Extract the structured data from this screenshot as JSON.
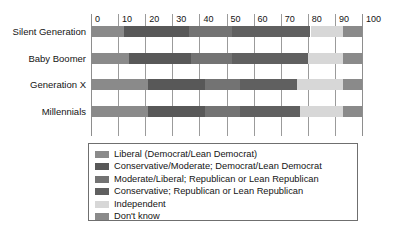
{
  "chart_data": {
    "type": "bar",
    "orientation": "horizontal",
    "stacked": true,
    "title": "",
    "xlabel": "",
    "ylabel": "",
    "xlim": [
      0,
      100
    ],
    "xticks": [
      0,
      10,
      20,
      30,
      40,
      50,
      60,
      70,
      80,
      90,
      100
    ],
    "grid": true,
    "legend_position": "bottom",
    "categories": [
      "Silent Generation",
      "Baby Boomer",
      "Generation X",
      "Millennials"
    ],
    "series": [
      {
        "name": "Liberal (Democrat/Lean Democrat)",
        "color": "#8a8a8a",
        "values": [
          12,
          14,
          21,
          21
        ]
      },
      {
        "name": "Conservative/Moderate; Democrat/Lean Democrat",
        "color": "#585858",
        "values": [
          24,
          23,
          21,
          21
        ]
      },
      {
        "name": "Moderate/Liberal; Republican or Lean Republican",
        "color": "#737373",
        "values": [
          16,
          15,
          13,
          13
        ]
      },
      {
        "name": "Conservative; Republican or Lean Republican",
        "color": "#606060",
        "values": [
          29,
          28,
          21,
          22
        ]
      },
      {
        "name": "Independent",
        "color": "#d7d7d7",
        "values": [
          12,
          13,
          17,
          16
        ]
      },
      {
        "name": "Don't know",
        "color": "#8a8a8a",
        "values": [
          7,
          7,
          7,
          7
        ]
      }
    ]
  },
  "legend": {
    "items": [
      {
        "label": "Liberal (Democrat/Lean Democrat)",
        "color": "#8a8a8a"
      },
      {
        "label": "Conservative/Moderate; Democrat/Lean Democrat",
        "color": "#585858"
      },
      {
        "label": "Moderate/Liberal; Republican or Lean Republican",
        "color": "#737373"
      },
      {
        "label": "Conservative; Republican or Lean Republican",
        "color": "#606060"
      },
      {
        "label": "Independent",
        "color": "#d7d7d7"
      },
      {
        "label": "Don't know",
        "color": "#8a8a8a"
      }
    ]
  },
  "axis": {
    "tick_labels": [
      "0",
      "10",
      "20",
      "30",
      "40",
      "50",
      "60",
      "70",
      "80",
      "90",
      "100"
    ]
  }
}
